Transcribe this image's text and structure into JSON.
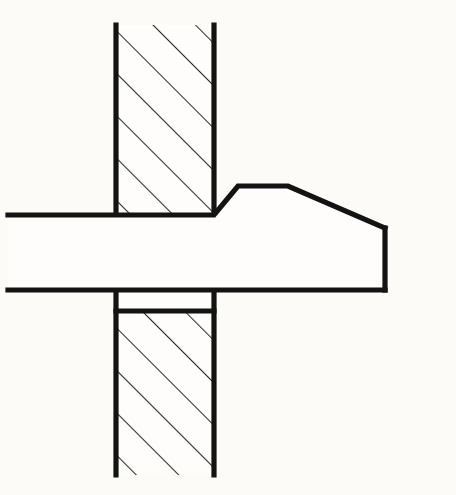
{
  "drawing": {
    "title": "Riveted joint sectional detail",
    "canvas": {
      "width": 456,
      "height": 495,
      "background": "#fdfbf7"
    },
    "style": {
      "line_color": "#131313",
      "hatch_color": "#2a2a2a",
      "outline_width": 5.2,
      "hatch_width": 2.1,
      "fill_color": "#fefdfb"
    },
    "parts": [
      {
        "name": "upper-plate",
        "label": "Upper sectioned plate",
        "type": "hatched-section",
        "bounds": {
          "x": 116,
          "y": 25,
          "width": 98,
          "height": 190
        },
        "hatch_angle_deg": 45,
        "hatch_spacing": 30
      },
      {
        "name": "lower-plate",
        "label": "Lower sectioned plate",
        "type": "hatched-section",
        "bounds": {
          "x": 116,
          "y": 311,
          "width": 98,
          "height": 164
        },
        "hatch_angle_deg": 45,
        "hatch_spacing": 30
      },
      {
        "name": "lower-plate-clearance-band",
        "label": "Unhatched clearance band",
        "type": "plain-section",
        "bounds": {
          "x": 116,
          "y": 290,
          "width": 98,
          "height": 21
        }
      },
      {
        "name": "rivet-shank",
        "label": "Rivet shank",
        "type": "unsectioned-solid",
        "top_line_y": 215,
        "bottom_line_y": 290,
        "left_x": 8
      },
      {
        "name": "rivet-head",
        "label": "Formed rivet head",
        "type": "unsectioned-solid",
        "vertices": [
          [
            214,
            215
          ],
          [
            238,
            186
          ],
          [
            288,
            186
          ],
          [
            385,
            228
          ],
          [
            385,
            290
          ]
        ]
      }
    ],
    "geometry": {
      "wall_left_x": 116,
      "wall_right_x": 214,
      "upper_wall_top_y": 25,
      "upper_wall_bottom_y": 215,
      "lower_wall_top_y": 290,
      "lower_wall_hatch_start_y": 311,
      "lower_wall_bottom_y": 475,
      "shaft_top_y": 215,
      "shaft_bottom_y": 290,
      "shaft_left_x": 8,
      "head_fillet_top_x": 238,
      "head_top_y": 186,
      "head_flat_end_x": 288,
      "head_right_x": 385,
      "head_shoulder_y": 228
    }
  }
}
